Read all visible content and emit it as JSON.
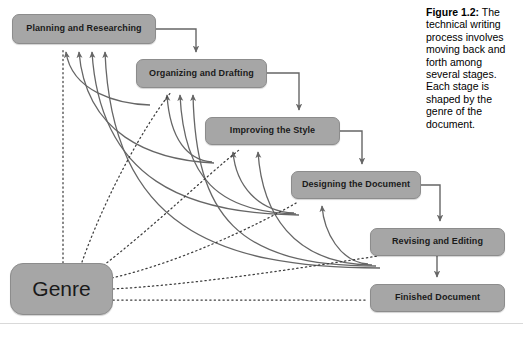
{
  "figure": {
    "caption_label": "Figure 1.2:",
    "caption_text": "The technical writing process involves moving back and forth among several stages. Each stage is shaped by the genre of the document."
  },
  "colors": {
    "box_fill": "#a6a6a6",
    "box_border": "#8c8c8c",
    "arrow_stroke": "#666666",
    "dotted_stroke": "#3d3d3d",
    "text": "#1a1a1a",
    "page_background": "#ffffff",
    "rule": "#d9d9d9"
  },
  "diagram": {
    "type": "process-flow",
    "title": "The technical writing process",
    "stages": [
      {
        "id": "planning",
        "label": "Planning and Researching",
        "x": 12,
        "y": 14,
        "w": 144,
        "h": 30
      },
      {
        "id": "organizing",
        "label": "Organizing and Drafting",
        "x": 136,
        "y": 59,
        "w": 131,
        "h": 29
      },
      {
        "id": "improving",
        "label": "Improving the Style",
        "x": 205,
        "y": 117,
        "w": 135,
        "h": 28
      },
      {
        "id": "designing",
        "label": "Designing the Document",
        "x": 291,
        "y": 171,
        "w": 130,
        "h": 28
      },
      {
        "id": "revising",
        "label": "Revising and Editing",
        "x": 370,
        "y": 228,
        "w": 135,
        "h": 28
      },
      {
        "id": "finished",
        "label": "Finished Document",
        "x": 370,
        "y": 284,
        "w": 135,
        "h": 28
      }
    ],
    "genre": {
      "id": "genre",
      "label": "Genre",
      "x": 10,
      "y": 263,
      "w": 103,
      "h": 52
    },
    "forward_flow": [
      {
        "from": "planning",
        "to": "organizing"
      },
      {
        "from": "organizing",
        "to": "improving"
      },
      {
        "from": "improving",
        "to": "designing"
      },
      {
        "from": "designing",
        "to": "revising"
      },
      {
        "from": "revising",
        "to": "finished"
      }
    ],
    "feedback_flow": [
      {
        "from": "organizing",
        "to": "planning"
      },
      {
        "from": "improving",
        "to": "planning"
      },
      {
        "from": "designing",
        "to": "planning"
      },
      {
        "from": "revising",
        "to": "planning"
      },
      {
        "from": "improving",
        "to": "organizing"
      },
      {
        "from": "designing",
        "to": "organizing"
      },
      {
        "from": "revising",
        "to": "organizing"
      },
      {
        "from": "designing",
        "to": "improving"
      },
      {
        "from": "revising",
        "to": "improving"
      },
      {
        "from": "revising",
        "to": "designing"
      }
    ],
    "genre_influence": [
      {
        "from": "genre",
        "to": "planning"
      },
      {
        "from": "genre",
        "to": "organizing"
      },
      {
        "from": "genre",
        "to": "improving"
      },
      {
        "from": "genre",
        "to": "designing"
      },
      {
        "from": "genre",
        "to": "revising"
      },
      {
        "from": "genre",
        "to": "finished"
      }
    ]
  }
}
